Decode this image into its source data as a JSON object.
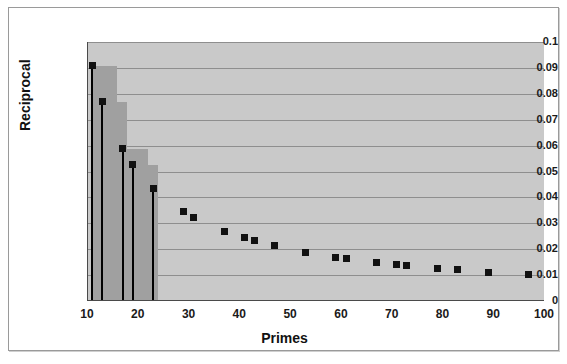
{
  "chart_data": {
    "type": "scatter",
    "title": "",
    "xlabel": "Primes",
    "ylabel": "Reciprocal",
    "xlim": [
      10,
      100
    ],
    "ylim": [
      0,
      0.1
    ],
    "grid": true,
    "legend": "none",
    "xticks": [
      "10",
      "20",
      "30",
      "40",
      "50",
      "60",
      "70",
      "80",
      "90",
      "100"
    ],
    "xtick_values": [
      10,
      20,
      30,
      40,
      50,
      60,
      70,
      80,
      90,
      100
    ],
    "yticks": [
      "0",
      "0.01",
      "0.02",
      "0.03",
      "0.04",
      "0.05",
      "0.06",
      "0.07",
      "0.08",
      "0.09",
      "0.1"
    ],
    "ytick_values": [
      0,
      0.01,
      0.02,
      0.03,
      0.04,
      0.05,
      0.06,
      0.07,
      0.08,
      0.09,
      0.1
    ],
    "marker_color": "#111111",
    "bar_color": "#a0a0a0",
    "plot_background": "#c9c9c9",
    "gridline_color": "#8e8e8e",
    "x": [
      11,
      13,
      17,
      19,
      23,
      29,
      31,
      37,
      41,
      43,
      47,
      53,
      59,
      61,
      67,
      71,
      73,
      79,
      83,
      89,
      97
    ],
    "values": [
      0.0909,
      0.0769,
      0.0588,
      0.0526,
      0.0435,
      0.0345,
      0.0323,
      0.027,
      0.0244,
      0.0233,
      0.0213,
      0.0189,
      0.0169,
      0.0164,
      0.0149,
      0.0141,
      0.0137,
      0.0127,
      0.012,
      0.0112,
      0.0103
    ],
    "stem_x": [
      11,
      13,
      17,
      19,
      23
    ],
    "bar_x": [
      11,
      13,
      17,
      19
    ],
    "bar_values": [
      0.0909,
      0.0769,
      0.0588,
      0.0526
    ]
  }
}
